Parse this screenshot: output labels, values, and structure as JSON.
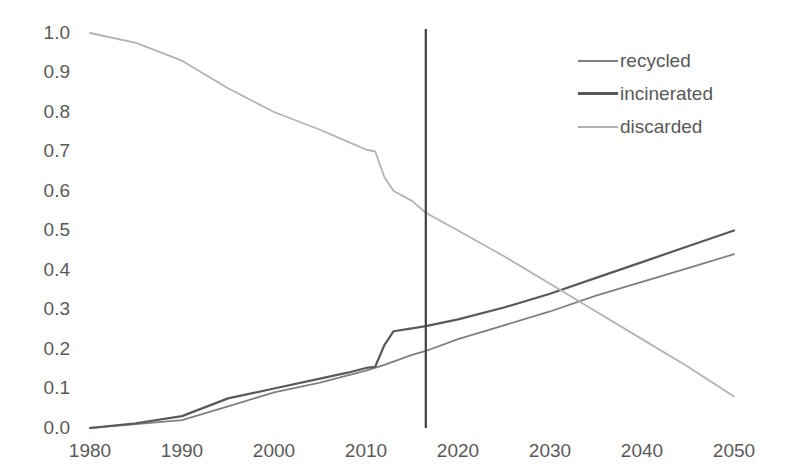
{
  "chart_data": {
    "type": "line",
    "title": "",
    "xlabel": "",
    "ylabel": "",
    "xlim": [
      1980,
      2050
    ],
    "ylim": [
      0.0,
      1.0
    ],
    "grid": false,
    "legend_position": "top-right",
    "x_ticks": [
      "1980",
      "1990",
      "2000",
      "2010",
      "2020",
      "2030",
      "2040",
      "2050"
    ],
    "y_ticks": [
      "0.0",
      "0.1",
      "0.2",
      "0.3",
      "0.4",
      "0.5",
      "0.6",
      "0.7",
      "0.8",
      "0.9",
      "1.0"
    ],
    "annotations": [
      {
        "name": "present-year-line",
        "type": "vline",
        "x": 2016.5,
        "color": "#3f3f3f"
      }
    ],
    "series": [
      {
        "name": "recycled",
        "color": "#7f7f7f",
        "x": [
          1980,
          1985,
          1990,
          1995,
          2000,
          2005,
          2010,
          2012,
          2015,
          2016.5,
          2020,
          2025,
          2030,
          2035,
          2040,
          2045,
          2050
        ],
        "values": [
          0.0,
          0.01,
          0.02,
          0.055,
          0.09,
          0.115,
          0.145,
          0.16,
          0.185,
          0.195,
          0.225,
          0.26,
          0.295,
          0.335,
          0.37,
          0.405,
          0.44
        ]
      },
      {
        "name": "incinerated",
        "color": "#595959",
        "x": [
          1980,
          1985,
          1990,
          1995,
          2000,
          2005,
          2008,
          2010,
          2011,
          2012,
          2013,
          2015,
          2016.5,
          2020,
          2025,
          2030,
          2035,
          2040,
          2045,
          2050
        ],
        "values": [
          0.0,
          0.012,
          0.03,
          0.075,
          0.1,
          0.125,
          0.14,
          0.152,
          0.155,
          0.21,
          0.245,
          0.252,
          0.258,
          0.275,
          0.305,
          0.34,
          0.38,
          0.42,
          0.46,
          0.5
        ]
      },
      {
        "name": "discarded",
        "color": "#b3b3b3",
        "x": [
          1980,
          1985,
          1990,
          1995,
          2000,
          2005,
          2008,
          2010,
          2011,
          2012,
          2013,
          2015,
          2016.5,
          2020,
          2025,
          2030,
          2035,
          2040,
          2045,
          2050
        ],
        "values": [
          1.0,
          0.975,
          0.93,
          0.86,
          0.8,
          0.755,
          0.725,
          0.705,
          0.7,
          0.635,
          0.6,
          0.575,
          0.545,
          0.5,
          0.435,
          0.365,
          0.295,
          0.225,
          0.155,
          0.08
        ]
      }
    ]
  },
  "legend": {
    "items": [
      {
        "label": "recycled",
        "color": "#7f7f7f",
        "width": 2
      },
      {
        "label": "incinerated",
        "color": "#595959",
        "width": 3
      },
      {
        "label": "discarded",
        "color": "#b3b3b3",
        "width": 2
      }
    ]
  },
  "axis": {
    "y_ticks": [
      {
        "label": "1.0",
        "y": 33
      },
      {
        "label": "0.9",
        "y": 72
      },
      {
        "label": "0.8",
        "y": 112
      },
      {
        "label": "0.7",
        "y": 151
      },
      {
        "label": "0.6",
        "y": 191
      },
      {
        "label": "0.5",
        "y": 230
      },
      {
        "label": "0.4",
        "y": 270
      },
      {
        "label": "0.3",
        "y": 309
      },
      {
        "label": "0.2",
        "y": 349
      },
      {
        "label": "0.1",
        "y": 388
      },
      {
        "label": "0.0",
        "y": 428
      }
    ],
    "x_ticks": [
      {
        "label": "1980",
        "x": 90
      },
      {
        "label": "1990",
        "x": 182
      },
      {
        "label": "2000",
        "x": 274
      },
      {
        "label": "2010",
        "x": 366
      },
      {
        "label": "2020",
        "x": 458
      },
      {
        "label": "2030",
        "x": 550
      },
      {
        "label": "2040",
        "x": 642
      },
      {
        "label": "2050",
        "x": 734
      }
    ]
  },
  "plot_geometry": {
    "left": 90,
    "right": 734,
    "top": 33,
    "bottom": 428
  }
}
